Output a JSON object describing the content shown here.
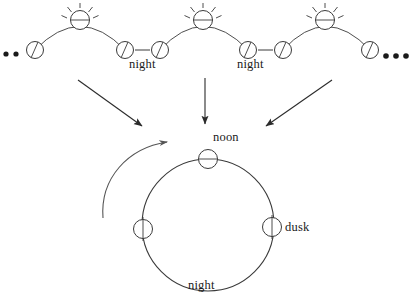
{
  "figure": {
    "type": "day-night-cycle-diagram",
    "background_color": "#ffffff",
    "stroke_color": "#3a3a3a",
    "text_color": "#1a1a1a",
    "width": 413,
    "height": 307
  },
  "top_row": {
    "description": "Three daytime arcs with a sun at each apex, separated by night gaps",
    "left_ellipsis": "••",
    "right_ellipsis": "•••",
    "night_labels": [
      {
        "text": "night",
        "x": 150,
        "y": 63
      },
      {
        "text": "night",
        "x": 257,
        "y": 63
      }
    ],
    "arcs": [
      {
        "start_x": 35,
        "apex_x": 80,
        "end_x": 125,
        "sun_x": 80,
        "sun_y": 20
      },
      {
        "start_x": 160,
        "apex_x": 205,
        "end_x": 248,
        "sun_x": 203,
        "sun_y": 20
      },
      {
        "start_x": 283,
        "apex_x": 326,
        "end_x": 370,
        "sun_x": 325,
        "sun_y": 20
      }
    ],
    "planet_markers": [
      {
        "x": 35,
        "y": 50,
        "line": "diagonal"
      },
      {
        "x": 125,
        "y": 50,
        "line": "diagonal"
      },
      {
        "x": 160,
        "y": 50,
        "line": "diagonal"
      },
      {
        "x": 248,
        "y": 50,
        "line": "diagonal"
      },
      {
        "x": 283,
        "y": 50,
        "line": "diagonal"
      },
      {
        "x": 370,
        "y": 50,
        "line": "diagonal"
      }
    ]
  },
  "arrows": {
    "left": {
      "x1": 78,
      "y1": 80,
      "x2": 145,
      "y2": 128
    },
    "middle": {
      "x1": 205,
      "y1": 78,
      "x2": 205,
      "y2": 126
    },
    "right": {
      "x1": 330,
      "y1": 80,
      "x2": 263,
      "y2": 128
    },
    "rotation_arrow_label": "counterclockwise-rotation"
  },
  "cycle_circle": {
    "center_x": 208,
    "center_y": 225,
    "radius": 66,
    "labels": [
      {
        "key": "noon",
        "text": "noon",
        "x": 219,
        "y": 134,
        "position": "top"
      },
      {
        "key": "dusk",
        "text": "dusk",
        "x": 277,
        "y": 224,
        "position": "right"
      },
      {
        "key": "night",
        "text": "night",
        "x": 191,
        "y": 283,
        "position": "bottom"
      }
    ],
    "markers": [
      {
        "key": "noon",
        "x": 208,
        "y": 159,
        "line": "horizontal"
      },
      {
        "key": "dusk",
        "x": 272,
        "y": 227,
        "line": "vertical"
      },
      {
        "key": "midnight",
        "x": 143,
        "y": 229,
        "line": "vertical"
      }
    ]
  }
}
